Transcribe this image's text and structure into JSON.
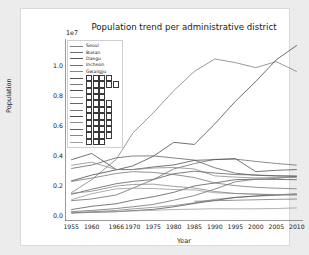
{
  "figure": {
    "background": "#ffffff",
    "page_background": "#ececec"
  },
  "chart_data": {
    "type": "line",
    "title": "Population trend per administrative district",
    "xlabel": "Year",
    "ylabel": "Population",
    "y_offset_text": "1e7",
    "grid": false,
    "legend_position": "upper left",
    "xlim": [
      1953.5,
      2011.5
    ],
    "ylim": [
      -300000.0,
      11800000.0
    ],
    "x": [
      1955,
      1960,
      1966,
      1970,
      1975,
      1980,
      1985,
      1990,
      1995,
      2000,
      2005,
      2010
    ],
    "xticks": [
      "1955",
      "1960",
      "1966",
      "1970",
      "1975",
      "1980",
      "1985",
      "1990",
      "1995",
      "2000",
      "2005",
      "2010"
    ],
    "yticks": [
      "0.0",
      "0.2",
      "0.4",
      "0.6",
      "0.8",
      "1.0"
    ],
    "ytick_values": [
      0,
      2000000,
      4000000,
      6000000,
      8000000,
      10000000
    ],
    "series": [
      {
        "name": "Seoul",
        "label": "Seoul",
        "color": "#808080",
        "values": [
          1570000,
          2445000,
          3805000,
          5536000,
          6890000,
          8364000,
          9639000,
          10473000,
          10231000,
          9895000,
          10297000,
          9631000
        ]
      },
      {
        "name": "Busan",
        "label": "Busan",
        "color": "#6e6e6e",
        "values": [
          1050000,
          1164000,
          1430000,
          1880000,
          2450000,
          3160000,
          3515000,
          3798000,
          3814000,
          3662000,
          3523000,
          3414000
        ]
      },
      {
        "name": "Daegu",
        "label": "Daegu",
        "color": "#5a5a5a",
        "values": [
          455000,
          679000,
          847000,
          1083000,
          1311000,
          1607000,
          2030000,
          2229000,
          2449000,
          2481000,
          2464000,
          2446000
        ]
      },
      {
        "name": "Incheon",
        "label": "Incheon",
        "color": "#707070",
        "values": [
          321000,
          401000,
          529000,
          646000,
          800000,
          1084000,
          1387000,
          1818000,
          2308000,
          2475000,
          2531000,
          2662000
        ]
      },
      {
        "name": "Gwangju",
        "label": "Gwangju",
        "color": "#888888",
        "values": [
          232000,
          314000,
          403000,
          503000,
          607000,
          727000,
          906000,
          1139000,
          1258000,
          1352000,
          1413000,
          1455000
        ]
      },
      {
        "name": "district-6",
        "label": "□□□□",
        "color": "#555555",
        "values": [
          230000,
          276000,
          316000,
          389000,
          470000,
          642000,
          866000,
          1062000,
          1272000,
          1365000,
          1442000,
          1502000
        ]
      },
      {
        "name": "district-7",
        "label": "□□□□□",
        "color": "#7a7a7a",
        "values": [
          null,
          null,
          null,
          null,
          null,
          null,
          1010000,
          1050000,
          1080000,
          1110000,
          1140000,
          1160000
        ]
      },
      {
        "name": "district-8",
        "label": "□□□",
        "color": "#4a4a4a",
        "values": [
          2360000,
          2750000,
          3100000,
          3360000,
          4000000,
          4930000,
          4790000,
          6150000,
          7650000,
          8980000,
          10420000,
          11380000
        ]
      },
      {
        "name": "district-9",
        "label": "□□□",
        "color": "#9a9a9a",
        "values": [
          1110000,
          1510000,
          1840000,
          1880000,
          1860000,
          1790000,
          1770000,
          1580000,
          1530000,
          1490000,
          1460000,
          1470000
        ]
      },
      {
        "name": "district-10",
        "label": "□□□□",
        "color": "#656565",
        "values": [
          3190000,
          3420000,
          3900000,
          4020000,
          4030000,
          3890000,
          3750000,
          3240000,
          2880000,
          2740000,
          2690000,
          2670000
        ]
      },
      {
        "name": "district-11",
        "label": "□□□□",
        "color": "#767676",
        "values": [
          2330000,
          2550000,
          2860000,
          2980000,
          2930000,
          2790000,
          2590000,
          2230000,
          2050000,
          1940000,
          1880000,
          1840000
        ]
      },
      {
        "name": "district-12",
        "label": "□□□□",
        "color": "#505050",
        "values": [
          3770000,
          4190000,
          3120000,
          3120000,
          3290000,
          3430000,
          3730000,
          3780000,
          3850000,
          2980000,
          3070000,
          3120000
        ]
      },
      {
        "name": "district-13",
        "label": "□□□□",
        "color": "#8c8c8c",
        "values": [
          3400000,
          3610000,
          3120000,
          3120000,
          3220000,
          3260000,
          3160000,
          2700000,
          2620000,
          2560000,
          2590000,
          2600000
        ]
      },
      {
        "name": "district-14",
        "label": "□□□□",
        "color": "#606060",
        "values": [
          1470000,
          1810000,
          2180000,
          2330000,
          2460000,
          2840000,
          3010000,
          2890000,
          2790000,
          2760000,
          2710000,
          2690000
        ]
      },
      {
        "name": "district-15",
        "label": "□□□□",
        "color": "#868686",
        "values": [
          1530000,
          1680000,
          2020000,
          2130000,
          2150000,
          2000000,
          1900000,
          1660000,
          1530000,
          1480000,
          1440000,
          1430000
        ]
      },
      {
        "name": "district-16",
        "label": "□□□",
        "color": "#9e9e9e",
        "values": [
          288000,
          281000,
          334000,
          365000,
          412000,
          462000,
          489000,
          514000,
          505000,
          513000,
          531000,
          571000
        ]
      }
    ]
  },
  "legend": {
    "entries": [
      {
        "label": "Seoul",
        "tofu": 0,
        "color": "#808080"
      },
      {
        "label": "Busan",
        "tofu": 0,
        "color": "#6e6e6e"
      },
      {
        "label": "Daegu",
        "tofu": 0,
        "color": "#5a5a5a"
      },
      {
        "label": "Incheon",
        "tofu": 0,
        "color": "#707070"
      },
      {
        "label": "Gwangju",
        "tofu": 0,
        "color": "#888888"
      },
      {
        "label": "",
        "tofu": 4,
        "color": "#555555"
      },
      {
        "label": "",
        "tofu": 5,
        "color": "#7a7a7a"
      },
      {
        "label": "",
        "tofu": 3,
        "color": "#4a4a4a"
      },
      {
        "label": "",
        "tofu": 3,
        "color": "#9a9a9a"
      },
      {
        "label": "",
        "tofu": 4,
        "color": "#656565"
      },
      {
        "label": "",
        "tofu": 4,
        "color": "#767676"
      },
      {
        "label": "",
        "tofu": 4,
        "color": "#505050"
      },
      {
        "label": "",
        "tofu": 4,
        "color": "#8c8c8c"
      },
      {
        "label": "",
        "tofu": 4,
        "color": "#606060"
      },
      {
        "label": "",
        "tofu": 4,
        "color": "#868686"
      },
      {
        "label": "",
        "tofu": 3,
        "color": "#9e9e9e"
      }
    ]
  }
}
